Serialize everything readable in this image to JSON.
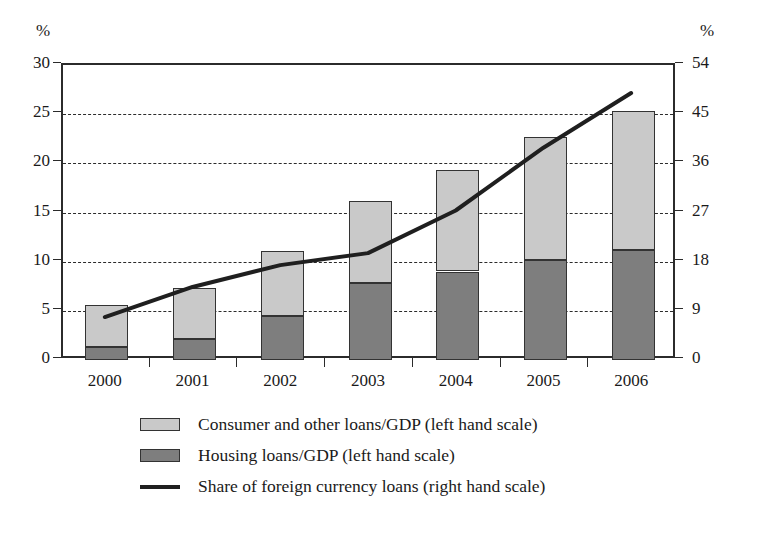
{
  "chart_data": {
    "type": "bar",
    "variant": "stacked-bar-with-line-overlay",
    "title": "",
    "subtitle": "",
    "xlabel": "",
    "categories": [
      "2000",
      "2001",
      "2002",
      "2003",
      "2004",
      "2005",
      "2006"
    ],
    "grid": true,
    "legend_position": "bottom",
    "axes": {
      "left": {
        "unit_label": "%",
        "ylabel": "",
        "ylim": [
          0,
          30
        ],
        "ticks": [
          0,
          5,
          10,
          15,
          20,
          25,
          30
        ],
        "tick_labels": [
          "0",
          "5",
          "10",
          "15",
          "20",
          "25",
          "30"
        ]
      },
      "right": {
        "unit_label": "%",
        "ylabel": "",
        "ylim": [
          0,
          54
        ],
        "ticks": [
          0,
          9,
          18,
          27,
          36,
          45,
          54
        ],
        "tick_labels": [
          "0",
          "9",
          "18",
          "27",
          "36",
          "45",
          "54"
        ]
      }
    },
    "series": [
      {
        "name": "Housing loans/GDP (left hand scale)",
        "short_name": "Housing loans/GDP",
        "type": "bar",
        "stack": "loans",
        "axis": "left",
        "color": "#7e7e7e",
        "values": [
          1.3,
          2.1,
          4.5,
          7.8,
          9.0,
          10.2,
          11.2
        ]
      },
      {
        "name": "Consumer and other loans/GDP (left hand scale)",
        "short_name": "Consumer and other loans/GDP",
        "type": "bar",
        "stack": "loans",
        "axis": "left",
        "color": "#c9c9c9",
        "values": [
          4.3,
          5.2,
          6.6,
          8.4,
          10.3,
          12.5,
          14.1
        ]
      },
      {
        "name": "Share of foreign currency loans (right hand scale)",
        "short_name": "Share of foreign currency loans",
        "type": "line",
        "axis": "right",
        "color": "#1f1f1f",
        "values": [
          7.5,
          13.0,
          17.0,
          19.2,
          27.0,
          38.5,
          48.5
        ]
      }
    ],
    "stack_totals": [
      5.6,
      7.3,
      11.1,
      16.2,
      19.3,
      22.7,
      25.3
    ]
  },
  "legend": {
    "items": [
      {
        "label": "Consumer and other loans/GDP (left hand scale)",
        "marker": "box",
        "color": "#c9c9c9"
      },
      {
        "label": "Housing loans/GDP (left hand scale)",
        "marker": "box",
        "color": "#7e7e7e"
      },
      {
        "label": "Share of foreign currency loans (right hand scale)",
        "marker": "line",
        "color": "#1f1f1f"
      }
    ]
  }
}
